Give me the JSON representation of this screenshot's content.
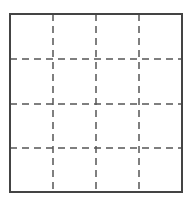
{
  "diagram": {
    "type": "grid",
    "rows": 4,
    "columns": 4,
    "outer_border": {
      "x": 10,
      "y": 14,
      "width": 172,
      "height": 178,
      "color": "#444444",
      "stroke_width": 2,
      "style": "solid"
    },
    "inner_lines": {
      "color": "#555555",
      "stroke_width": 1.5,
      "style": "dashed",
      "dash": "7,5"
    },
    "vertical_lines_x": [
      53,
      96,
      139
    ],
    "horizontal_lines_y": [
      59,
      104,
      148
    ]
  }
}
